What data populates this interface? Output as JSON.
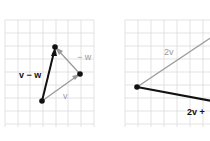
{
  "left_panel": {
    "labels": {
      "v_minus_w": "v − w",
      "neg_w": "− w",
      "v": "v"
    },
    "points": [
      {
        "name": "origin",
        "x": 42,
        "y": 101
      },
      {
        "name": "v_tip",
        "x": 80,
        "y": 74
      },
      {
        "name": "v_minus_w_tip",
        "x": 55,
        "y": 47
      }
    ]
  },
  "right_panel": {
    "labels": {
      "two_v": "2v",
      "two_v_plus": "2v +"
    }
  },
  "colors": {
    "grid": "#d8d8d8",
    "gray_vector": "#9a9a9a",
    "black_vector": "#111111"
  }
}
